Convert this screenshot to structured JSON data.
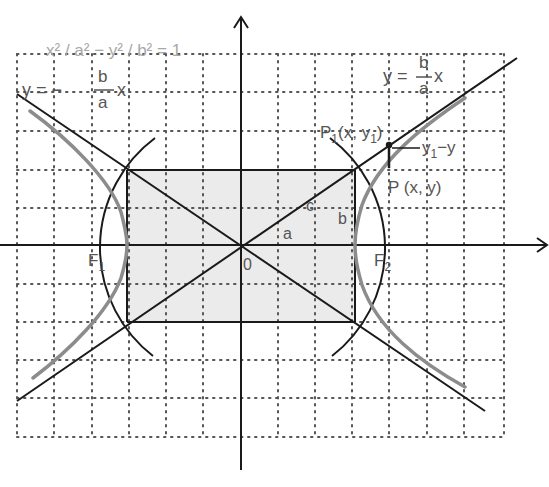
{
  "figure": {
    "equation": "x² / a² − y² / b² = 1",
    "asymptote_neg": {
      "lhs": "y = −",
      "num": "b",
      "den": "a",
      "rhs": "x"
    },
    "asymptote_pos": {
      "lhs": "y = ",
      "num": "b",
      "den": "a",
      "rhs": "x"
    },
    "point_p1": {
      "main": "P",
      "sub": "1",
      "rest": "(x, y",
      "sub2": "1",
      "close": ")"
    },
    "point_p": "P (x, y)",
    "difference": {
      "main": "y",
      "sub": "1",
      "rest": "−y"
    },
    "focus_left": {
      "main": "F",
      "sub": "1"
    },
    "focus_right": {
      "main": "F",
      "sub": "2"
    },
    "origin": "0",
    "seg_a": "a",
    "seg_b": "b",
    "seg_c": "c"
  },
  "colors": {
    "axis": "#1a1a1a",
    "hyperbola": "#8c8c8c",
    "rectangle_fill": "#ebebeb",
    "grid": "#555555",
    "label": "#555555",
    "equation": "#a8a8a8"
  }
}
